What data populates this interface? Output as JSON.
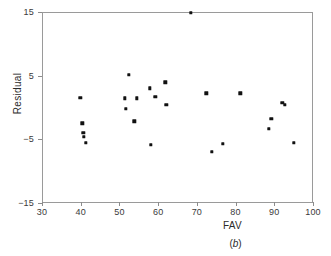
{
  "figure": {
    "caption": "(b)",
    "caption_letter": "b"
  },
  "chart_data": {
    "type": "scatter",
    "title": "",
    "xlabel": "FAV",
    "ylabel": "Residual",
    "xlim": [
      30,
      100
    ],
    "ylim": [
      -15,
      15
    ],
    "xticks": [
      30,
      40,
      50,
      60,
      70,
      80,
      90,
      100
    ],
    "xticklabels": [
      "30",
      "40",
      "50",
      "60",
      "70",
      "80",
      "90",
      "100"
    ],
    "yticks": [
      15,
      5,
      -5,
      -15
    ],
    "yticklabels": [
      "15",
      "5",
      "−5",
      "−15"
    ],
    "grid": false,
    "legend": null,
    "marker": "square",
    "marker_color": "#111111",
    "points": [
      {
        "x": 39.6,
        "y": 1.7
      },
      {
        "x": 40.2,
        "y": -2.3
      },
      {
        "x": 40.4,
        "y": -3.8
      },
      {
        "x": 40.6,
        "y": -4.4
      },
      {
        "x": 41.0,
        "y": -5.4
      },
      {
        "x": 51.2,
        "y": 1.6
      },
      {
        "x": 51.4,
        "y": 0.0
      },
      {
        "x": 52.2,
        "y": 5.3
      },
      {
        "x": 53.6,
        "y": -2.0
      },
      {
        "x": 54.2,
        "y": 1.6
      },
      {
        "x": 57.6,
        "y": 3.2
      },
      {
        "x": 57.8,
        "y": -5.7
      },
      {
        "x": 59.0,
        "y": 1.8
      },
      {
        "x": 61.6,
        "y": 4.1
      },
      {
        "x": 61.8,
        "y": 0.6
      },
      {
        "x": 68.2,
        "y": 15.0
      },
      {
        "x": 72.2,
        "y": 2.4
      },
      {
        "x": 73.6,
        "y": -6.8
      },
      {
        "x": 76.4,
        "y": -5.5
      },
      {
        "x": 81.0,
        "y": 2.4
      },
      {
        "x": 88.4,
        "y": -3.2
      },
      {
        "x": 89.0,
        "y": -1.6
      },
      {
        "x": 91.8,
        "y": 0.9
      },
      {
        "x": 92.4,
        "y": 0.6
      },
      {
        "x": 94.8,
        "y": -5.4
      }
    ]
  }
}
